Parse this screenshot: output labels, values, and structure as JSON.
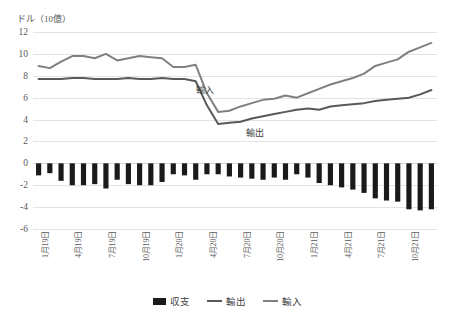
{
  "chart_data": {
    "type": "bar",
    "title": "",
    "unit_caption": "ドル（10億）",
    "xlabel": "",
    "ylabel": "",
    "ylim": [
      -6,
      12
    ],
    "yticks": [
      12,
      10,
      8,
      6,
      4,
      2,
      0,
      -2,
      -4,
      -6
    ],
    "grid": true,
    "legend_position": "bottom",
    "x_tick_labels": [
      "1月19日",
      "4月19日",
      "7月19日",
      "10月19日",
      "1月20日",
      "4月20日",
      "7月20日",
      "10月20日",
      "1月21日",
      "4月21日",
      "7月21日",
      "10月21日"
    ],
    "x_tick_indices": [
      0,
      3,
      6,
      9,
      12,
      15,
      18,
      21,
      24,
      27,
      30,
      33
    ],
    "x": [
      "2019-01",
      "2019-02",
      "2019-03",
      "2019-04",
      "2019-05",
      "2019-06",
      "2019-07",
      "2019-08",
      "2019-09",
      "2019-10",
      "2019-11",
      "2019-12",
      "2020-01",
      "2020-02",
      "2020-03",
      "2020-04",
      "2020-05",
      "2020-06",
      "2020-07",
      "2020-08",
      "2020-09",
      "2020-10",
      "2020-11",
      "2020-12",
      "2021-01",
      "2021-02",
      "2021-03",
      "2021-04",
      "2021-05",
      "2021-06",
      "2021-07",
      "2021-08",
      "2021-09",
      "2021-10",
      "2021-11",
      "2021-12"
    ],
    "series": [
      {
        "name": "収支",
        "type": "bar",
        "color": "#1a1a1a",
        "values": [
          -1.1,
          -0.9,
          -1.6,
          -2.0,
          -2.0,
          -1.9,
          -2.3,
          -1.5,
          -1.9,
          -2.0,
          -2.0,
          -1.7,
          -1.0,
          -1.1,
          -1.5,
          -1.0,
          -1.0,
          -1.2,
          -1.3,
          -1.4,
          -1.5,
          -1.3,
          -1.5,
          -1.0,
          -1.3,
          -1.8,
          -2.0,
          -2.2,
          -2.4,
          -2.7,
          -3.2,
          -3.4,
          -3.5,
          -4.2,
          -4.3,
          -4.2
        ]
      },
      {
        "name": "輸出",
        "type": "line",
        "color": "#595959",
        "values": [
          7.7,
          7.7,
          7.7,
          7.8,
          7.8,
          7.7,
          7.7,
          7.7,
          7.8,
          7.7,
          7.7,
          7.8,
          7.7,
          7.7,
          7.5,
          5.3,
          3.6,
          3.7,
          3.8,
          4.1,
          4.3,
          4.5,
          4.7,
          4.9,
          5.0,
          4.9,
          5.2,
          5.3,
          5.4,
          5.5,
          5.7,
          5.8,
          5.9,
          6.0,
          6.3,
          6.7
        ]
      },
      {
        "name": "輸入",
        "type": "line",
        "color": "#808080",
        "values": [
          8.9,
          8.7,
          9.3,
          9.8,
          9.8,
          9.6,
          10.0,
          9.4,
          9.6,
          9.8,
          9.7,
          9.6,
          8.8,
          8.8,
          9.0,
          6.4,
          4.7,
          4.8,
          5.2,
          5.5,
          5.8,
          5.9,
          6.2,
          6.0,
          6.4,
          6.8,
          7.2,
          7.5,
          7.8,
          8.2,
          8.9,
          9.2,
          9.5,
          10.2,
          10.6,
          11.0
        ]
      }
    ],
    "annotations": [
      {
        "id": "tag-imports",
        "text": "輸入"
      },
      {
        "id": "tag-exports",
        "text": "輸出"
      }
    ],
    "legend": [
      {
        "label": "収支",
        "color": "#1a1a1a",
        "marker": "bar"
      },
      {
        "label": "輸出",
        "color": "#595959",
        "marker": "line"
      },
      {
        "label": "輸入",
        "color": "#808080",
        "marker": "line"
      }
    ]
  }
}
